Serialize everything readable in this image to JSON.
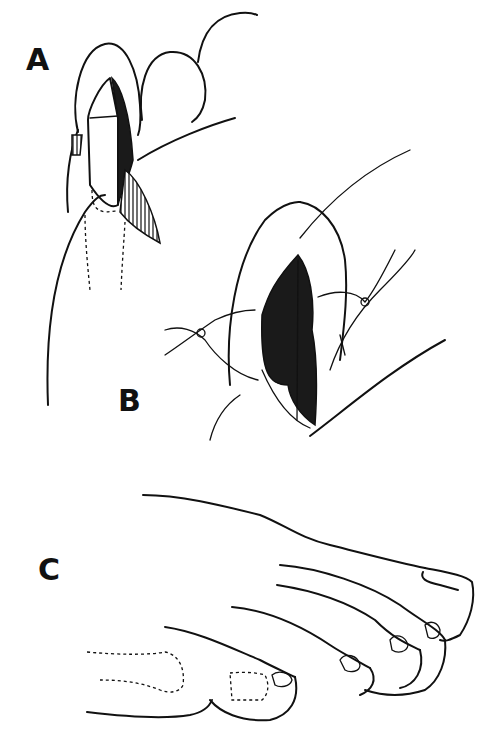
{
  "figure": {
    "panels": [
      {
        "label": "A",
        "description": "Nail fold with wedge excision of ingrown nail edge"
      },
      {
        "label": "B",
        "description": "Closure of wound with sutures"
      },
      {
        "label": "C",
        "description": "Foot showing toes after procedure"
      }
    ]
  },
  "colors": {
    "ink": "#111111",
    "background": "#ffffff"
  }
}
